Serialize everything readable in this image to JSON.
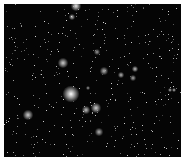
{
  "image": {
    "description": "Astronomical star field, grayscale, dense small stars with several bright haloed stars",
    "background": "#050505",
    "border": "#ffffff",
    "frame": {
      "x": 4,
      "y": 4,
      "width": 177,
      "height": 153
    }
  },
  "bright_stars": [
    {
      "x": 71,
      "y": 94,
      "r": 8,
      "intensity": 1.0
    },
    {
      "x": 76,
      "y": 6,
      "r": 5,
      "intensity": 0.9
    },
    {
      "x": 72,
      "y": 17,
      "r": 3,
      "intensity": 0.7
    },
    {
      "x": 63,
      "y": 63,
      "r": 5,
      "intensity": 0.8
    },
    {
      "x": 97,
      "y": 52,
      "r": 3,
      "intensity": 0.6
    },
    {
      "x": 104,
      "y": 71,
      "r": 4,
      "intensity": 0.7
    },
    {
      "x": 121,
      "y": 75,
      "r": 3,
      "intensity": 0.7
    },
    {
      "x": 135,
      "y": 69,
      "r": 3,
      "intensity": 0.75
    },
    {
      "x": 133,
      "y": 78,
      "r": 3,
      "intensity": 0.65
    },
    {
      "x": 170,
      "y": 90,
      "r": 2,
      "intensity": 0.7
    },
    {
      "x": 174,
      "y": 90,
      "r": 2,
      "intensity": 0.7
    },
    {
      "x": 28,
      "y": 115,
      "r": 5,
      "intensity": 0.8
    },
    {
      "x": 86,
      "y": 110,
      "r": 4,
      "intensity": 0.75
    },
    {
      "x": 96,
      "y": 108,
      "r": 5,
      "intensity": 0.8
    },
    {
      "x": 99,
      "y": 132,
      "r": 4,
      "intensity": 0.7
    },
    {
      "x": 88,
      "y": 88,
      "r": 2,
      "intensity": 0.6
    }
  ],
  "faint_star_count": 420
}
